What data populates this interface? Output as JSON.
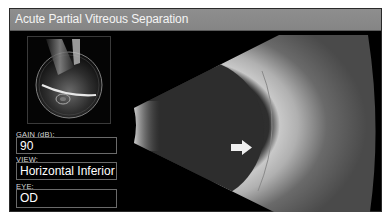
{
  "window": {
    "title": "Acute Partial Vitreous Separation"
  },
  "probe_diagram": {
    "icon": "probe-position-diagram"
  },
  "fields": [
    {
      "label": "GAIN (dB):",
      "value": "90"
    },
    {
      "label": "VIEW:",
      "value": "Horizontal Inferior"
    },
    {
      "label": "EYE:",
      "value": "OD"
    }
  ],
  "scan": {
    "type": "B-scan ultrasound",
    "annotation": "arrow-right-icon"
  },
  "colors": {
    "titlebar": "#8a8a8a",
    "background": "#000000",
    "text": "#ffffff"
  }
}
